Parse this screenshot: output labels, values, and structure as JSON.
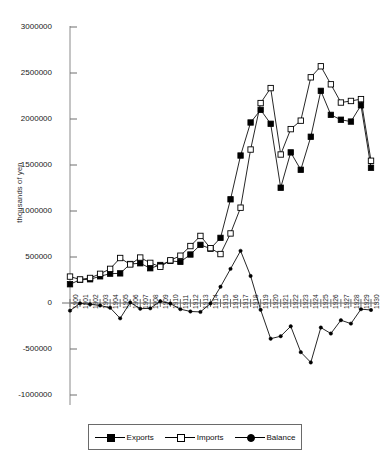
{
  "chart_data": {
    "type": "line",
    "title": "",
    "xlabel": "",
    "ylabel": "thousands of yen",
    "ylim": [
      -1000000,
      3000000
    ],
    "ytick_step": 500000,
    "yticks": [
      3000000,
      2500000,
      2000000,
      1500000,
      1000000,
      500000,
      0,
      -500000,
      -1000000
    ],
    "ytick_labels": [
      "3000000",
      "2500000",
      "2000000",
      "1500000",
      "1000000",
      "500000",
      "0",
      "-500000",
      "-1000000"
    ],
    "grid": false,
    "legend_position": "bottom",
    "categories": [
      "1900",
      "1901",
      "1902",
      "1903",
      "1904",
      "1905",
      "1906",
      "1907",
      "1908",
      "1909",
      "1910",
      "1911",
      "1912",
      "1913",
      "1914",
      "1915",
      "1916",
      "1917",
      "1918",
      "1919",
      "1920",
      "1921",
      "1922",
      "1923",
      "1924",
      "1925",
      "1926",
      "1927",
      "1928",
      "1929",
      "1930"
    ],
    "series": [
      {
        "name": "Exports",
        "marker": "filled-square",
        "values": [
          204000,
          252000,
          258000,
          290000,
          319000,
          322000,
          424000,
          432000,
          378000,
          413000,
          458000,
          447000,
          527000,
          632000,
          591000,
          708000,
          1127000,
          1603000,
          1962000,
          2099000,
          1948000,
          1253000,
          1637000,
          1448000,
          1807000,
          2306000,
          2045000,
          1992000,
          1972000,
          2149000,
          1470000
        ]
      },
      {
        "name": "Imports",
        "marker": "open-square",
        "values": [
          287000,
          256000,
          272000,
          317000,
          371000,
          489000,
          419000,
          494000,
          436000,
          394000,
          464000,
          514000,
          619000,
          729000,
          596000,
          532000,
          756000,
          1036000,
          1668000,
          2173000,
          2336000,
          1614000,
          1890000,
          1982000,
          2453000,
          2573000,
          2377000,
          2179000,
          2196000,
          2216000,
          1546000
        ]
      },
      {
        "name": "Balance",
        "marker": "dot",
        "values": [
          -83000,
          -4000,
          -14000,
          -27000,
          -52000,
          -167000,
          5000,
          -62000,
          -58000,
          19000,
          -6000,
          -67000,
          -92000,
          -97000,
          -5000,
          176000,
          371000,
          567000,
          294000,
          -74000,
          -388000,
          -361000,
          -253000,
          -534000,
          -646000,
          -267000,
          -332000,
          -187000,
          -224000,
          -67000,
          -76000
        ]
      }
    ]
  },
  "legend": {
    "items": [
      {
        "label": "Exports",
        "marker": "filled-square"
      },
      {
        "label": "Imports",
        "marker": "open-square"
      },
      {
        "label": "Balance",
        "marker": "dot"
      }
    ]
  }
}
